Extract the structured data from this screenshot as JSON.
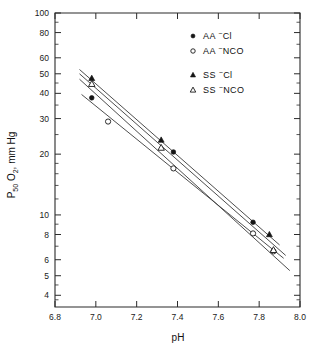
{
  "chart_data": {
    "type": "scatter",
    "title": "",
    "xlabel": "pH",
    "ylabel": "P50 O2, mm Hg",
    "yscale": "log",
    "xscale": "linear",
    "xlim": [
      6.8,
      8.0
    ],
    "ylim": [
      3.5,
      100
    ],
    "grid": false,
    "legend_position": "top-right",
    "xticks": [
      "6.8",
      "7.0",
      "7.2",
      "7.4",
      "7.6",
      "7.8",
      "8.0"
    ],
    "xtick_values": [
      6.8,
      7.0,
      7.2,
      7.4,
      7.6,
      7.8,
      8.0
    ],
    "yticks": [
      "100",
      "80",
      "60",
      "50",
      "40",
      "30",
      "20",
      "10",
      "8",
      "6",
      "5",
      "4"
    ],
    "ytick_values": [
      100,
      80,
      60,
      50,
      40,
      30,
      20,
      10,
      8,
      6,
      5,
      4
    ],
    "y_minor_ticks": [
      90,
      70,
      45,
      35,
      25,
      18,
      16,
      14,
      12,
      9,
      7,
      4.5,
      3.8
    ],
    "series": [
      {
        "name": "AA ⁻Cl",
        "marker": "filled-circle",
        "points": [
          {
            "x": 6.98,
            "y": 38.0
          },
          {
            "x": 7.38,
            "y": 20.5
          },
          {
            "x": 7.77,
            "y": 9.2
          }
        ],
        "fit_line": {
          "x1": 6.92,
          "y1": 47.0,
          "x2": 7.95,
          "y2": 5.3
        }
      },
      {
        "name": "AA ⁻NCO",
        "marker": "open-circle",
        "points": [
          {
            "x": 7.06,
            "y": 29.0
          },
          {
            "x": 7.38,
            "y": 17.0
          },
          {
            "x": 7.77,
            "y": 8.1
          },
          {
            "x": 7.87,
            "y": 6.6
          }
        ],
        "fit_line": {
          "x1": 6.93,
          "y1": 39.5,
          "x2": 7.92,
          "y2": 6.1
        }
      },
      {
        "name": "SS ⁻Cl",
        "marker": "filled-triangle",
        "points": [
          {
            "x": 6.98,
            "y": 47.5
          },
          {
            "x": 7.32,
            "y": 23.5
          },
          {
            "x": 7.85,
            "y": 8.0
          }
        ],
        "fit_line": {
          "x1": 6.92,
          "y1": 52.5,
          "x2": 7.9,
          "y2": 7.1
        }
      },
      {
        "name": "SS ⁻NCO",
        "marker": "open-triangle",
        "points": [
          {
            "x": 6.98,
            "y": 44.5
          },
          {
            "x": 7.32,
            "y": 21.5
          },
          {
            "x": 7.87,
            "y": 6.7
          }
        ],
        "fit_line": {
          "x1": 6.92,
          "y1": 50.0,
          "x2": 7.93,
          "y2": 6.3
        }
      }
    ]
  },
  "axis": {
    "x_title": "pH",
    "y_title_main": "P",
    "y_title_sub1": "50",
    "y_title_mid": " O",
    "y_title_sub2": "2",
    "y_title_tail": ", mm Hg"
  },
  "legend": {
    "entries": [
      {
        "marker": "filled-circle",
        "sample": "AA",
        "charge": "−",
        "ligand": "Cl"
      },
      {
        "marker": "open-circle",
        "sample": "AA",
        "charge": "−",
        "ligand": "NCO"
      },
      {
        "marker": "filled-triangle",
        "sample": "SS",
        "charge": "−",
        "ligand": "Cl"
      },
      {
        "marker": "open-triangle",
        "sample": "SS",
        "charge": "−",
        "ligand": "NCO"
      }
    ]
  },
  "colors": {
    "ink": "#1a1a1a",
    "line": "#3a3a3a",
    "background": "#ffffff"
  }
}
